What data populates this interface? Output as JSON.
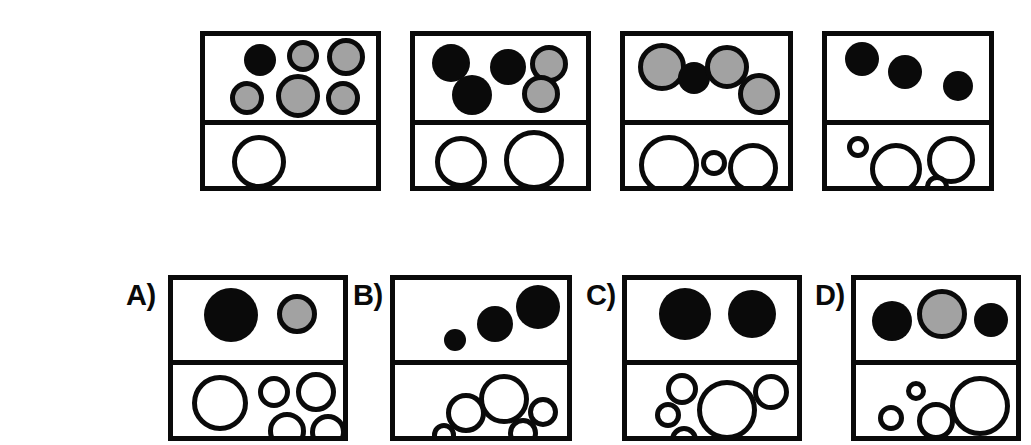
{
  "figure": {
    "kind": "visual-analogy-puzzle",
    "colors": {
      "outline": "#0a0a0a",
      "fill_black": "#0a0a0a",
      "fill_gray": "#a2a2a2",
      "fill_white": "#ffffff",
      "background": "#ffffff"
    },
    "sequence_label": "",
    "sequence": [
      {
        "name": "sequence-panel-1",
        "index": 1,
        "frame": {
          "x": 200,
          "y": 31,
          "w": 181,
          "h": 160,
          "divider_y": 84
        },
        "top_cell": {
          "counts": {
            "black": 1,
            "gray": 5,
            "total": 6
          },
          "circles": [
            {
              "fill": "black",
              "cx": 55,
              "cy": 24,
              "r": 16
            },
            {
              "fill": "gray",
              "cx": 98,
              "cy": 20,
              "r": 16
            },
            {
              "fill": "gray",
              "cx": 141,
              "cy": 21,
              "r": 19
            },
            {
              "fill": "gray",
              "cx": 42,
              "cy": 62,
              "r": 17
            },
            {
              "fill": "gray",
              "cx": 93,
              "cy": 60,
              "r": 22
            },
            {
              "fill": "gray",
              "cx": 138,
              "cy": 62,
              "r": 17
            }
          ]
        },
        "bottom_cell": {
          "counts": {
            "white": 1,
            "total": 1
          },
          "circles": [
            {
              "fill": "white",
              "cx": 54,
              "cy": 37,
              "r": 27
            }
          ]
        }
      },
      {
        "name": "sequence-panel-2",
        "index": 2,
        "frame": {
          "x": 410,
          "y": 31,
          "w": 181,
          "h": 160,
          "divider_y": 84
        },
        "top_cell": {
          "counts": {
            "black": 3,
            "gray": 2,
            "total": 5
          },
          "circles": [
            {
              "fill": "black",
              "cx": 36,
              "cy": 27,
              "r": 19
            },
            {
              "fill": "black",
              "cx": 93,
              "cy": 31,
              "r": 18
            },
            {
              "fill": "gray",
              "cx": 134,
              "cy": 28,
              "r": 19
            },
            {
              "fill": "black",
              "cx": 57,
              "cy": 59,
              "r": 20
            },
            {
              "fill": "gray",
              "cx": 126,
              "cy": 58,
              "r": 19
            }
          ]
        },
        "bottom_cell": {
          "counts": {
            "white": 2,
            "total": 2
          },
          "circles": [
            {
              "fill": "white",
              "cx": 46,
              "cy": 37,
              "r": 26
            },
            {
              "fill": "white",
              "cx": 119,
              "cy": 35,
              "r": 30
            }
          ]
        }
      },
      {
        "name": "sequence-panel-3",
        "index": 3,
        "frame": {
          "x": 620,
          "y": 31,
          "w": 173,
          "h": 160,
          "divider_y": 84
        },
        "top_cell": {
          "counts": {
            "black": 1,
            "gray": 3,
            "total": 4
          },
          "circles": [
            {
              "fill": "gray",
              "cx": 37,
              "cy": 31,
              "r": 24
            },
            {
              "fill": "black",
              "cx": 69,
              "cy": 42,
              "r": 16
            },
            {
              "fill": "gray",
              "cx": 102,
              "cy": 31,
              "r": 22
            },
            {
              "fill": "gray",
              "cx": 134,
              "cy": 58,
              "r": 21
            }
          ]
        },
        "bottom_cell": {
          "counts": {
            "white": 3,
            "total": 3
          },
          "circles": [
            {
              "fill": "white",
              "cx": 44,
              "cy": 40,
              "r": 30
            },
            {
              "fill": "white",
              "cx": 89,
              "cy": 38,
              "r": 13
            },
            {
              "fill": "white",
              "cx": 128,
              "cy": 43,
              "r": 25
            }
          ]
        }
      },
      {
        "name": "sequence-panel-4",
        "index": 4,
        "frame": {
          "x": 822,
          "y": 31,
          "w": 172,
          "h": 160,
          "divider_y": 84
        },
        "top_cell": {
          "counts": {
            "black": 3,
            "gray": 0,
            "total": 3
          },
          "circles": [
            {
              "fill": "black",
              "cx": 35,
              "cy": 23,
              "r": 17
            },
            {
              "fill": "black",
              "cx": 78,
              "cy": 36,
              "r": 17
            },
            {
              "fill": "black",
              "cx": 131,
              "cy": 50,
              "r": 15
            }
          ]
        },
        "bottom_cell": {
          "counts": {
            "white": 4,
            "total": 4
          },
          "circles": [
            {
              "fill": "white",
              "cx": 31,
              "cy": 22,
              "r": 11
            },
            {
              "fill": "white",
              "cx": 69,
              "cy": 44,
              "r": 26
            },
            {
              "fill": "white",
              "cx": 124,
              "cy": 35,
              "r": 24
            },
            {
              "fill": "white",
              "cx": 110,
              "cy": 62,
              "r": 12
            }
          ]
        }
      }
    ],
    "options": [
      {
        "name": "option-a",
        "letter": "A)",
        "label_pos": {
          "x": 126,
          "y": 281
        },
        "frame": {
          "x": 168,
          "y": 275,
          "w": 180,
          "h": 166,
          "divider_y": 80
        },
        "top_cell": {
          "counts": {
            "black": 1,
            "gray": 1,
            "total": 2
          },
          "circles": [
            {
              "fill": "black",
              "cx": 58,
              "cy": 35,
              "r": 27
            },
            {
              "fill": "gray",
              "cx": 124,
              "cy": 34,
              "r": 20
            }
          ]
        },
        "bottom_cell": {
          "counts": {
            "white": 5,
            "total": 5
          },
          "circles": [
            {
              "fill": "white",
              "cx": 47,
              "cy": 38,
              "r": 28
            },
            {
              "fill": "white",
              "cx": 101,
              "cy": 27,
              "r": 16
            },
            {
              "fill": "white",
              "cx": 143,
              "cy": 27,
              "r": 20
            },
            {
              "fill": "white",
              "cx": 114,
              "cy": 66,
              "r": 19
            },
            {
              "fill": "white",
              "cx": 155,
              "cy": 67,
              "r": 18
            }
          ]
        }
      },
      {
        "name": "option-b",
        "letter": "B)",
        "label_pos": {
          "x": 353,
          "y": 281
        },
        "frame": {
          "x": 390,
          "y": 275,
          "w": 182,
          "h": 166,
          "divider_y": 80
        },
        "top_cell": {
          "counts": {
            "black": 3,
            "gray": 0,
            "total": 3
          },
          "circles": [
            {
              "fill": "black",
              "cx": 143,
              "cy": 27,
              "r": 22
            },
            {
              "fill": "black",
              "cx": 100,
              "cy": 44,
              "r": 18
            },
            {
              "fill": "black",
              "cx": 60,
              "cy": 60,
              "r": 11
            }
          ]
        },
        "bottom_cell": {
          "counts": {
            "white": 5,
            "total": 5
          },
          "circles": [
            {
              "fill": "white",
              "cx": 109,
              "cy": 34,
              "r": 25
            },
            {
              "fill": "white",
              "cx": 71,
              "cy": 48,
              "r": 20
            },
            {
              "fill": "white",
              "cx": 148,
              "cy": 47,
              "r": 15
            },
            {
              "fill": "white",
              "cx": 128,
              "cy": 68,
              "r": 15
            },
            {
              "fill": "white",
              "cx": 49,
              "cy": 70,
              "r": 12
            }
          ]
        }
      },
      {
        "name": "option-c",
        "letter": "C)",
        "label_pos": {
          "x": 586,
          "y": 281
        },
        "frame": {
          "x": 622,
          "y": 275,
          "w": 180,
          "h": 166,
          "divider_y": 80
        },
        "top_cell": {
          "counts": {
            "black": 2,
            "gray": 0,
            "total": 2
          },
          "circles": [
            {
              "fill": "black",
              "cx": 58,
              "cy": 34,
              "r": 26
            },
            {
              "fill": "black",
              "cx": 125,
              "cy": 34,
              "r": 24
            }
          ]
        },
        "bottom_cell": {
          "counts": {
            "white": 5,
            "total": 5
          },
          "circles": [
            {
              "fill": "white",
              "cx": 100,
              "cy": 45,
              "r": 30
            },
            {
              "fill": "white",
              "cx": 55,
              "cy": 24,
              "r": 16
            },
            {
              "fill": "white",
              "cx": 144,
              "cy": 27,
              "r": 18
            },
            {
              "fill": "white",
              "cx": 41,
              "cy": 50,
              "r": 13
            },
            {
              "fill": "white",
              "cx": 57,
              "cy": 75,
              "r": 14
            }
          ]
        }
      },
      {
        "name": "option-d",
        "letter": "D)",
        "label_pos": {
          "x": 815,
          "y": 281
        },
        "frame": {
          "x": 851,
          "y": 275,
          "w": 170,
          "h": 166,
          "divider_y": 80
        },
        "top_cell": {
          "counts": {
            "black": 2,
            "gray": 1,
            "total": 3
          },
          "circles": [
            {
              "fill": "black",
              "cx": 36,
              "cy": 41,
              "r": 20
            },
            {
              "fill": "gray",
              "cx": 86,
              "cy": 34,
              "r": 25
            },
            {
              "fill": "black",
              "cx": 135,
              "cy": 40,
              "r": 17
            }
          ]
        },
        "bottom_cell": {
          "counts": {
            "white": 4,
            "total": 4
          },
          "circles": [
            {
              "fill": "white",
              "cx": 124,
              "cy": 41,
              "r": 30
            },
            {
              "fill": "white",
              "cx": 60,
              "cy": 26,
              "r": 10
            },
            {
              "fill": "white",
              "cx": 80,
              "cy": 56,
              "r": 19
            },
            {
              "fill": "white",
              "cx": 35,
              "cy": 53,
              "r": 13
            }
          ]
        }
      }
    ]
  }
}
